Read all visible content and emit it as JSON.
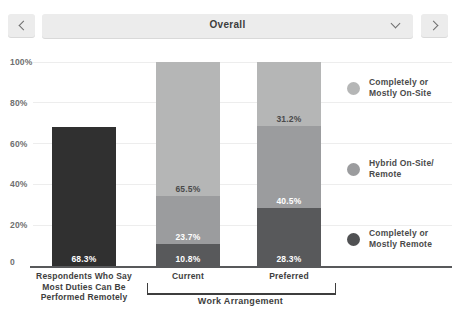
{
  "header": {
    "prev_icon": "chevron-left",
    "next_icon": "chevron-right",
    "dropdown": {
      "value": "Overall",
      "icon": "chevron-down"
    }
  },
  "colors": {
    "header_button_bg": "#ececec",
    "axis_line": "#58595b",
    "gridline": "#ededed",
    "tick_text": "#6f6f6f",
    "category_text": "#3e3e3e",
    "legend_text": "#4a4a4a"
  },
  "chart_data": {
    "type": "bar",
    "stacked": true,
    "title": "",
    "xlabel": "",
    "ylabel": "",
    "y_axis": {
      "min": 0,
      "max": 100,
      "grid": true,
      "ticks": [
        {
          "label": "100%",
          "value": 100
        },
        {
          "label": "80%",
          "value": 80
        },
        {
          "label": "60%",
          "value": 60
        },
        {
          "label": "40%",
          "value": 40
        },
        {
          "label": "20%",
          "value": 20
        },
        {
          "label": "0",
          "value": 0
        }
      ]
    },
    "bars": [
      {
        "category": "Respondents Who Say Most Duties Can Be Performed Remotely",
        "label_lines": [
          "Respondents Who Say",
          "Most Duties Can Be",
          "Performed Remotely"
        ],
        "segments": [
          {
            "name": "Respondents who say most duties can be performed remotely",
            "value": 68.3,
            "display": "68.3%",
            "color": "#303030",
            "text_color": "#ffffff"
          }
        ]
      },
      {
        "category": "Current",
        "label_lines": [
          "Current"
        ],
        "segments": [
          {
            "name": "Completely or Mostly Remote",
            "value": 10.8,
            "display": "10.8%",
            "color": "#58595b",
            "text_color": "#ffffff"
          },
          {
            "name": "Hybrid On-Site/Remote",
            "value": 23.7,
            "display": "23.7%",
            "color": "#9b9c9e",
            "text_color": "#ffffff"
          },
          {
            "name": "Completely or Mostly On-Site",
            "value": 65.5,
            "display": "65.5%",
            "color": "#b5b6b6",
            "text_color": "#4a4a4a"
          }
        ]
      },
      {
        "category": "Preferred",
        "label_lines": [
          "Preferred"
        ],
        "segments": [
          {
            "name": "Completely or Mostly Remote",
            "value": 28.3,
            "display": "28.3%",
            "color": "#58595b",
            "text_color": "#ffffff"
          },
          {
            "name": "Hybrid On-Site/Remote",
            "value": 40.5,
            "display": "40.5%",
            "color": "#9b9c9e",
            "text_color": "#ffffff"
          },
          {
            "name": "Completely or Mostly On-Site",
            "value": 31.2,
            "display": "31.2%",
            "color": "#b5b6b6",
            "text_color": "#4a4a4a"
          }
        ]
      }
    ],
    "group_bracket": {
      "label": "Work Arrangement",
      "covers": [
        "Current",
        "Preferred"
      ]
    },
    "legend": {
      "position": "right",
      "entries": [
        {
          "label": "Completely or Mostly On-Site",
          "label_lines": [
            "Completely or",
            "Mostly On-Site"
          ],
          "color": "#b5b6b6"
        },
        {
          "label": "Hybrid On-Site/Remote",
          "label_lines": [
            "Hybrid On-Site/",
            "Remote"
          ],
          "color": "#9b9c9e"
        },
        {
          "label": "Completely or Mostly Remote",
          "label_lines": [
            "Completely or",
            "Mostly Remote"
          ],
          "color": "#505153"
        }
      ]
    }
  }
}
